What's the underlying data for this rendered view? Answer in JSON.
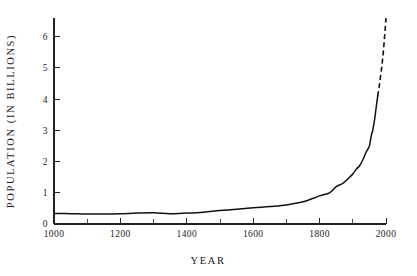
{
  "chart_data": {
    "type": "line",
    "title": "",
    "xlabel": "YEAR",
    "ylabel": "POPULATION (IN BILLIONS)",
    "xlim": [
      1000,
      2000
    ],
    "ylim": [
      0,
      6.6
    ],
    "grid": false,
    "legend": null,
    "x_ticks_major": [
      1000,
      1200,
      1400,
      1600,
      1800,
      2000
    ],
    "x_ticks_minor": [
      1100,
      1300,
      1500,
      1700,
      1900
    ],
    "y_ticks_major": [
      0,
      1,
      2,
      3,
      4,
      5,
      6
    ],
    "x_tick_labels": [
      "1000",
      "1200",
      "1400",
      "1600",
      "1800",
      "2000"
    ],
    "y_tick_labels": [
      "0",
      "1",
      "2",
      "3",
      "4",
      "5",
      "6"
    ],
    "series": [
      {
        "name": "World population (historical)",
        "style": "solid",
        "x": [
          1000,
          1050,
          1100,
          1150,
          1200,
          1250,
          1300,
          1350,
          1400,
          1450,
          1500,
          1550,
          1600,
          1650,
          1700,
          1750,
          1800,
          1830,
          1850,
          1870,
          1890,
          1900,
          1910,
          1920,
          1930,
          1940,
          1950,
          1955,
          1960,
          1965,
          1970,
          1975
        ],
        "y": [
          0.34,
          0.33,
          0.32,
          0.32,
          0.33,
          0.35,
          0.36,
          0.33,
          0.35,
          0.38,
          0.43,
          0.47,
          0.52,
          0.56,
          0.61,
          0.71,
          0.9,
          1.0,
          1.2,
          1.3,
          1.5,
          1.6,
          1.75,
          1.86,
          2.05,
          2.3,
          2.5,
          2.8,
          3.0,
          3.3,
          3.7,
          4.1
        ]
      },
      {
        "name": "World population (projected)",
        "style": "dashed",
        "x": [
          1975,
          1980,
          1985,
          1990,
          1995,
          2000
        ],
        "y": [
          4.1,
          4.45,
          4.85,
          5.3,
          5.9,
          6.6
        ]
      }
    ],
    "colors": {
      "curve": "#111111",
      "axis": "#222222",
      "text": "#1a1a1a",
      "background": "#ffffff"
    }
  },
  "geometry": {
    "plot_left": 54,
    "plot_right": 386,
    "plot_top": 18,
    "plot_bottom": 224,
    "y_unit_px": 30.5,
    "x_unit_px": 0.332
  }
}
